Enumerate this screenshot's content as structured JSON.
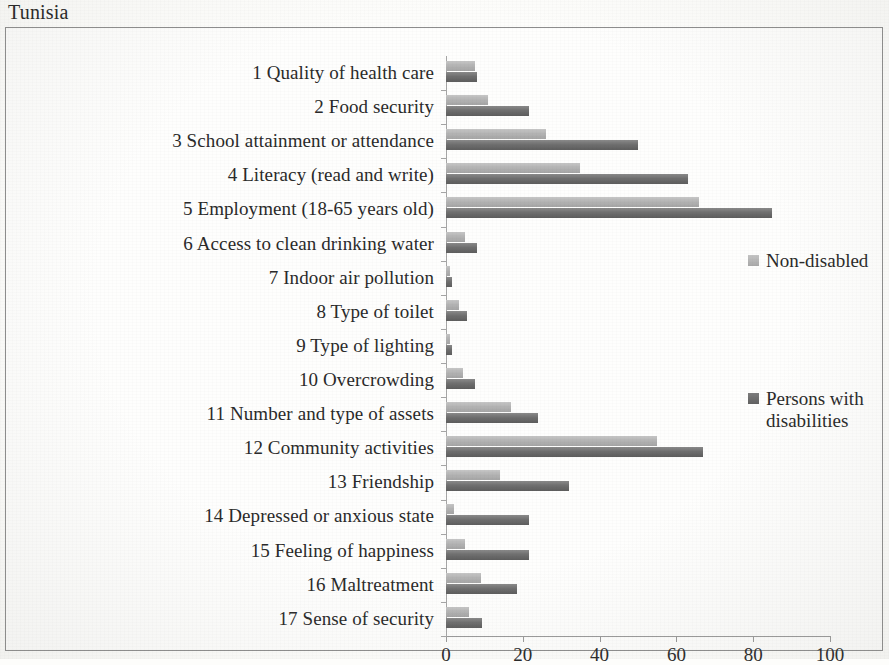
{
  "title": "Tunisia",
  "legend": {
    "position": "right",
    "entries": [
      {
        "label": "Non-disabled",
        "color": "#b0b0b0",
        "swatch": "light"
      },
      {
        "label": "Persons with disabilities",
        "color": "#6f6f6f",
        "swatch": "dark"
      }
    ]
  },
  "axis": {
    "ticks": [
      0,
      20,
      40,
      60,
      80,
      100
    ],
    "tick_labels": [
      "0",
      "20",
      "40",
      "60",
      "80",
      "100"
    ]
  },
  "chart_data": {
    "type": "bar",
    "orientation": "horizontal",
    "title": "Tunisia",
    "xlabel": "",
    "ylabel": "",
    "xlim": [
      0,
      100
    ],
    "grid": false,
    "legend_position": "right",
    "categories": [
      "1 Quality of health care",
      "2 Food security",
      "3 School attainment or attendance",
      "4 Literacy (read and write)",
      "5 Employment  (18-65 years old)",
      "6 Access to clean drinking water",
      "7 Indoor air pollution",
      "8 Type of toilet",
      "9 Type of lighting",
      "10 Overcrowding",
      "11 Number and type of assets",
      "12 Community activities",
      "13 Friendship",
      "14 Depressed or anxious state",
      "15 Feeling of happiness",
      "16 Maltreatment",
      "17 Sense of security"
    ],
    "series": [
      {
        "name": "Non-disabled",
        "color": "#b0b0b0",
        "values": [
          7.5,
          11,
          26,
          35,
          66,
          5,
          1,
          3.5,
          1,
          4.5,
          17,
          55,
          14,
          2,
          5,
          9,
          6
        ]
      },
      {
        "name": "Persons with disabilities",
        "color": "#6f6f6f",
        "values": [
          8,
          21.5,
          50,
          63,
          85,
          8,
          1.5,
          5.5,
          1.5,
          7.5,
          24,
          67,
          32,
          21.5,
          21.5,
          18.5,
          9.5
        ]
      }
    ]
  }
}
